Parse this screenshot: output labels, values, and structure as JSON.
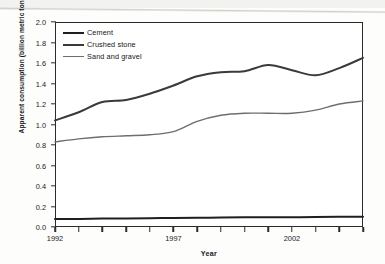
{
  "figure": {
    "kind": "scanned-line-chart",
    "background": "#fdfdfc"
  },
  "axes": {
    "y_title": "Apparent consumption (billion metric tons per year)",
    "x_title": "Year",
    "y_tick_labels": [
      "2.0",
      "1.8",
      "1.6",
      "1.4",
      "1.2",
      "1.0",
      "0.8",
      "0.6",
      "0.4",
      "0.2",
      "0.0"
    ],
    "x_tick_labels": [
      "1992",
      "1997",
      "2002"
    ]
  },
  "legend": {
    "items": [
      {
        "label": "Cement",
        "color": "#1f1f1f",
        "width": 2.1
      },
      {
        "label": "Crushed stone",
        "color": "#3a3a3a",
        "width": 2.0
      },
      {
        "label": "Sand and gravel",
        "color": "#6e6e6e",
        "width": 1.5
      }
    ]
  },
  "chart_data": {
    "type": "line",
    "title": "",
    "xlabel": "Year",
    "ylabel": "Apparent consumption (billion metric tons per year)",
    "xlim": [
      1992,
      2005
    ],
    "ylim": [
      0.0,
      2.0
    ],
    "ytick_step": 0.2,
    "grid": false,
    "legend_position": "top-left inside plot",
    "x": [
      1992,
      1993,
      1994,
      1995,
      1996,
      1997,
      1998,
      1999,
      2000,
      2001,
      2002,
      2003,
      2004,
      2005
    ],
    "series": [
      {
        "name": "Crushed stone",
        "color": "#3a3a3a",
        "values": [
          1.04,
          1.12,
          1.22,
          1.24,
          1.3,
          1.38,
          1.47,
          1.51,
          1.52,
          1.58,
          1.53,
          1.48,
          1.55,
          1.65
        ]
      },
      {
        "name": "Sand and gravel",
        "color": "#6e6e6e",
        "values": [
          0.83,
          0.86,
          0.88,
          0.89,
          0.9,
          0.93,
          1.03,
          1.09,
          1.11,
          1.11,
          1.11,
          1.14,
          1.2,
          1.23
        ]
      },
      {
        "name": "Cement",
        "color": "#1f1f1f",
        "values": [
          0.077,
          0.079,
          0.082,
          0.084,
          0.086,
          0.088,
          0.09,
          0.092,
          0.094,
          0.095,
          0.096,
          0.097,
          0.099,
          0.1
        ]
      }
    ]
  }
}
